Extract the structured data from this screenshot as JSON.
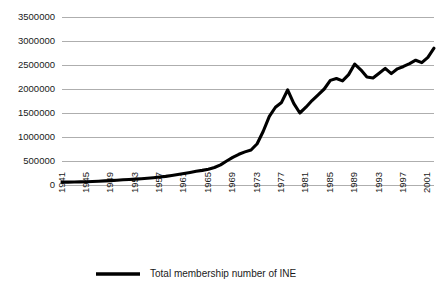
{
  "chart_data": {
    "type": "line",
    "title": "",
    "subtitle": "",
    "xlabel": "",
    "ylabel": "",
    "grid": "horizontal",
    "legend_position": "bottom-left",
    "xlim": [
      1941,
      2002
    ],
    "ylim": [
      0,
      3500000
    ],
    "ytick_labels": [
      "0",
      "500000",
      "1000000",
      "1500000",
      "2000000",
      "2500000",
      "3000000",
      "3500000"
    ],
    "ytick_values": [
      0,
      500000,
      1000000,
      1500000,
      2000000,
      2500000,
      3000000,
      3500000
    ],
    "xtick_labels": [
      "1941",
      "1945",
      "1949",
      "1953",
      "1957",
      "1961",
      "1965",
      "1969",
      "1973",
      "1977",
      "1981",
      "1985",
      "1989",
      "1993",
      "1997",
      "2001"
    ],
    "xtick_values": [
      1941,
      1945,
      1949,
      1953,
      1957,
      1961,
      1965,
      1969,
      1973,
      1977,
      1981,
      1985,
      1989,
      1993,
      1997,
      2001
    ],
    "series": [
      {
        "name": "Total membership number of INE",
        "color": "#000000",
        "x": [
          1941,
          1942,
          1943,
          1944,
          1945,
          1946,
          1947,
          1948,
          1949,
          1950,
          1951,
          1952,
          1953,
          1954,
          1955,
          1956,
          1957,
          1958,
          1959,
          1960,
          1961,
          1962,
          1963,
          1964,
          1965,
          1966,
          1967,
          1968,
          1969,
          1970,
          1971,
          1972,
          1973,
          1974,
          1975,
          1976,
          1977,
          1978,
          1979,
          1980,
          1981,
          1982,
          1983,
          1984,
          1985,
          1986,
          1987,
          1988,
          1989,
          1990,
          1991,
          1992,
          1993,
          1994,
          1995,
          1996,
          1997,
          1998,
          1999,
          2000,
          2001,
          2002
        ],
        "values": [
          60000,
          60000,
          62000,
          65000,
          68000,
          72000,
          78000,
          85000,
          92000,
          100000,
          108000,
          115000,
          122000,
          130000,
          140000,
          152000,
          165000,
          180000,
          198000,
          218000,
          240000,
          262000,
          285000,
          305000,
          330000,
          365000,
          420000,
          500000,
          575000,
          640000,
          690000,
          730000,
          860000,
          1120000,
          1430000,
          1620000,
          1720000,
          1980000,
          1700000,
          1500000,
          1620000,
          1760000,
          1880000,
          2000000,
          2180000,
          2220000,
          2170000,
          2300000,
          2520000,
          2400000,
          2250000,
          2230000,
          2330000,
          2430000,
          2320000,
          2420000,
          2470000,
          2530000,
          2600000,
          2550000,
          2660000,
          2850000
        ]
      }
    ]
  },
  "legend": {
    "entries": [
      {
        "label": "Total membership number of INE"
      }
    ]
  }
}
